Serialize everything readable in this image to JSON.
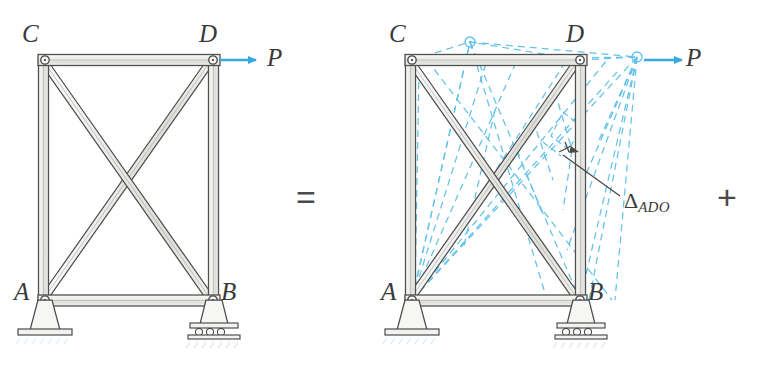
{
  "figure": {
    "background": "#ffffff",
    "ink_color": "#4a4a4a",
    "member_fill": "#e9e9e7",
    "accent_color": "#4db4e4",
    "dash_color": "#63c2ea"
  },
  "operators": {
    "equals": "=",
    "plus": "+"
  },
  "left_truss": {
    "name": "original-truss",
    "joint_labels": {
      "A": "A",
      "B": "B",
      "C": "C",
      "D": "D"
    },
    "load_label": "P",
    "support_a_type": "pin-support",
    "support_b_type": "roller-support",
    "geometry": {
      "A": [
        45,
        300
      ],
      "B": [
        213,
        300
      ],
      "C": [
        45,
        60
      ],
      "D": [
        213,
        60
      ]
    },
    "members": [
      "AC",
      "BD",
      "CD",
      "AB",
      "AD",
      "CB"
    ],
    "load_arrow": {
      "from": [
        222,
        60
      ],
      "to": [
        262,
        60
      ],
      "label_at": [
        272,
        60
      ]
    }
  },
  "right_truss": {
    "name": "deflected-truss",
    "joint_labels": {
      "A": "A",
      "B": "B",
      "C": "C",
      "D": "D"
    },
    "load_label": "P",
    "deflection_label": "Δ",
    "deflection_subscript": "ADO",
    "support_a_type": "pin-support",
    "support_b_type": "roller-support",
    "geometry": {
      "A": [
        412,
        300
      ],
      "B": [
        580,
        300
      ],
      "C": [
        412,
        60
      ],
      "D": [
        580,
        60
      ],
      "C_displaced": [
        470,
        42
      ],
      "D_displaced": [
        637,
        57
      ]
    },
    "members": [
      "AC",
      "BD",
      "CD",
      "AB",
      "AD",
      "CB"
    ],
    "load_arrow": {
      "from": [
        646,
        60
      ],
      "to": [
        686,
        60
      ],
      "label_at": [
        694,
        60
      ]
    },
    "leader_line": {
      "from": [
        620,
        196
      ],
      "to": [
        566,
        157
      ]
    },
    "dimension_tick_at": [
      566,
      157
    ]
  }
}
